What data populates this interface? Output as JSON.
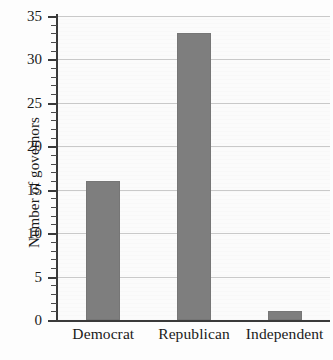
{
  "chart_data": {
    "type": "bar",
    "title": "",
    "xlabel": "",
    "ylabel": "Number of governors",
    "categories": [
      "Democrat",
      "Republican",
      "Independent"
    ],
    "values": [
      16,
      33,
      1
    ],
    "ylim": [
      0,
      35
    ],
    "yticks": [
      0,
      5,
      10,
      15,
      20,
      25,
      30,
      35
    ],
    "ytick_labels": [
      "0",
      "5",
      "10",
      "15",
      "20",
      "25",
      "30",
      "35"
    ],
    "minor_tick_interval": 1,
    "grid": "horizontal",
    "legend": "none",
    "bar_color": "#7e7e7e",
    "axis_color": "#3a3a3a",
    "gridline_color": "#c9c9c9",
    "background_color": "#fbfbfb"
  }
}
